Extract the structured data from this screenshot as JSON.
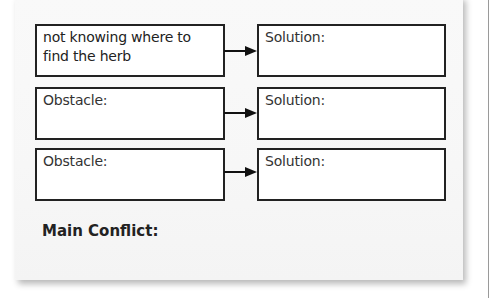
{
  "worksheet": {
    "rows": [
      {
        "obstacle": "not knowing where to find the herb",
        "solution": "Solution:"
      },
      {
        "obstacle": "Obstacle:",
        "solution": "Solution:"
      },
      {
        "obstacle": "Obstacle:",
        "solution": "Solution:"
      }
    ],
    "main_conflict_label": "Main Conflict:",
    "arrow_icon": "right-arrow-icon"
  }
}
